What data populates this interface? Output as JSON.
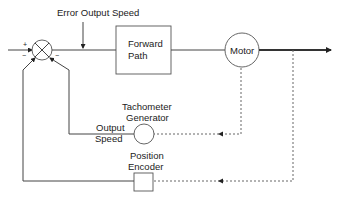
{
  "diagram": {
    "type": "control-loop-block-diagram",
    "labels": {
      "error_output_speed": "Error Output Speed",
      "forward_path_line1": "Forward",
      "forward_path_line2": "Path",
      "motor": "Motor",
      "tachometer_line1": "Tachometer",
      "tachometer_line2": "Generator",
      "output_speed_line1": "Output",
      "output_speed_line2": "Speed",
      "encoder_line1": "Position",
      "encoder_line2": "Encoder"
    },
    "summing_junction": {
      "signs": {
        "input_top": "+",
        "input_bottom": "−",
        "right": "−"
      }
    },
    "blocks": [
      {
        "id": "summing-junction",
        "shape": "circle-x"
      },
      {
        "id": "forward-path",
        "shape": "rectangle"
      },
      {
        "id": "motor",
        "shape": "circle"
      },
      {
        "id": "tachometer-generator",
        "shape": "circle"
      },
      {
        "id": "position-encoder",
        "shape": "square"
      }
    ],
    "connections": [
      {
        "from": "input",
        "to": "summing-junction",
        "style": "solid"
      },
      {
        "from": "summing-junction",
        "to": "forward-path",
        "style": "solid"
      },
      {
        "from": "forward-path",
        "to": "motor",
        "style": "solid"
      },
      {
        "from": "motor",
        "to": "output",
        "style": "thick-arrow"
      },
      {
        "from": "motor",
        "to": "tachometer-generator",
        "style": "dotted"
      },
      {
        "from": "output",
        "to": "position-encoder",
        "style": "dotted"
      },
      {
        "from": "tachometer-generator",
        "to": "summing-junction",
        "style": "solid"
      },
      {
        "from": "position-encoder",
        "to": "summing-junction",
        "style": "solid"
      }
    ]
  }
}
